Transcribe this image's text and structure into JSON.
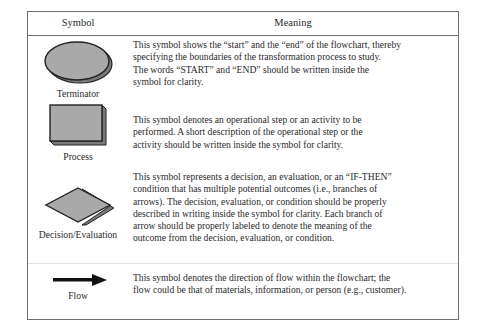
{
  "table": {
    "headers": {
      "symbol": "Symbol",
      "meaning": "Meaning"
    },
    "rows": [
      {
        "symbol_name": "Terminator",
        "shape_icon": "terminator-oval-icon",
        "meaning": "This symbol shows the “start” and the “end” of the flowchart, thereby specifying the boundaries of the transformation process to study. The words “START” and “END” should be written inside the symbol for clarity.",
        "meaning_lines": [
          "This symbol shows the “start” and the “end” of the flowchart, thereby",
          "specifying the boundaries of the transformation process to study.",
          "The words “START” and “END” should be written inside the",
          "symbol for clarity."
        ]
      },
      {
        "symbol_name": "Process",
        "shape_icon": "process-rectangle-icon",
        "meaning": "This symbol denotes an operational step or an activity to be performed. A short description of the operational step or the activity should be written inside the symbol for clarity.",
        "meaning_lines": [
          "This symbol denotes an operational step or an activity to be",
          "performed. A short description of the operational step or the",
          "activity should be written inside the symbol for clarity."
        ]
      },
      {
        "symbol_name": "Decision/Evaluation",
        "shape_icon": "decision-diamond-icon",
        "meaning": "This symbol represents a decision, an evaluation, or an “IF-THEN” condition that has multiple potential outcomes (i.e., branches of arrows). The decision, evaluation, or condition should be properly described in writing inside the symbol for clarity. Each branch of arrow should be properly labeled to denote the meaning of the outcome from the decision, evaluation, or condition.",
        "meaning_lines": [
          "This symbol represents a decision, an evaluation, or an “IF-THEN”",
          "condition that has multiple potential outcomes (i.e., branches of",
          "arrows). The decision, evaluation, or condition should be properly",
          "described in writing inside the symbol for clarity. Each branch of",
          "arrow should be properly labeled to denote the meaning of the",
          "outcome from the decision, evaluation, or condition."
        ]
      },
      {
        "symbol_name": "Flow",
        "shape_icon": "flow-arrow-icon",
        "meaning": "This symbol denotes the direction of flow within the flowchart; the flow could be that of materials, information, or person (e.g., customer).",
        "meaning_lines": [
          "This symbol denotes the direction of flow within the flowchart; the",
          "flow could be that of materials, information, or person (e.g., customer)."
        ]
      }
    ]
  },
  "colors": {
    "border": "#6f6f6f",
    "shape_fill": "#a9a9a9",
    "shape_shadow": "#7a7a7a",
    "shape_outline": "#222222",
    "text": "#2a2a2a"
  }
}
